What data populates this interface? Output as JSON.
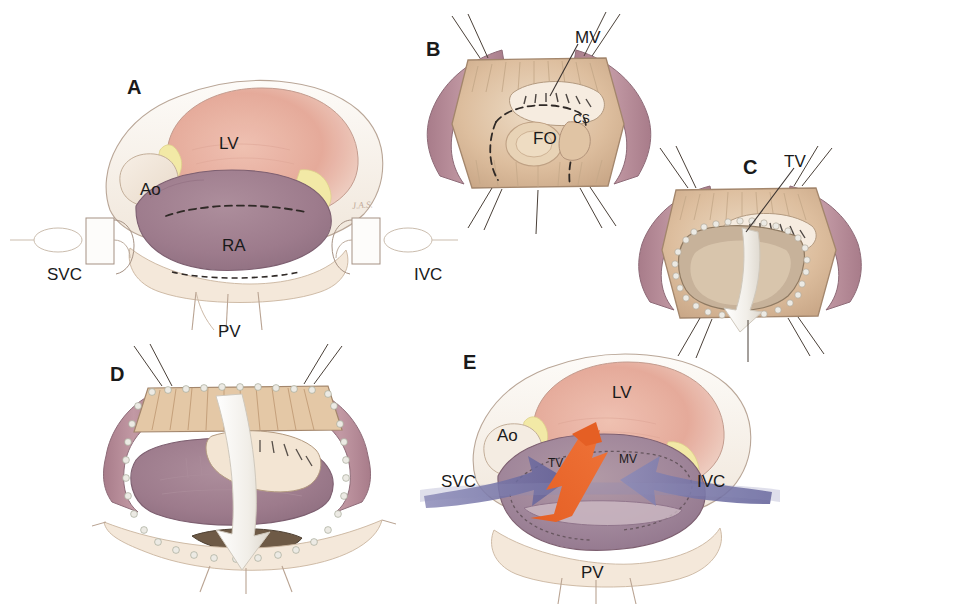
{
  "figure": {
    "background_color": "#ffffff",
    "panel_count": 5
  },
  "palette": {
    "left_ventricle": "#e5a898",
    "right_atrium": "#9d7b8c",
    "aorta_pale": "#f4ece4",
    "pericardium_cream": "#f7f1e8",
    "fat_yellow": "#f2e9a6",
    "endocardium_tan": "#ddbe9e",
    "cut_edge_mauve": "#b08490",
    "suture_dot": "#e8e6e0",
    "dashed_line": "#3a3330",
    "white_arrow": "#f4f2ee",
    "blue_flow_arrow": "#6b6a9e",
    "orange_flow_arrow": "#e8622a",
    "label_text": "#1a1a1a",
    "outline": "#8a7a6e"
  },
  "panels": [
    {
      "id": "panel-a",
      "letter": "A",
      "caption_implicit": "Exposed heart with SVC and IVC cannulated, dashed atriotomy line on right atrium",
      "labels": [
        {
          "name": "lv",
          "text": "LV",
          "x": 219,
          "y": 134
        },
        {
          "name": "ao",
          "text": "Ao",
          "x": 140,
          "y": 180
        },
        {
          "name": "ra",
          "text": "RA",
          "x": 222,
          "y": 236
        },
        {
          "name": "svc",
          "text": "SVC",
          "x": 47,
          "y": 265
        },
        {
          "name": "ivc",
          "text": "IVC",
          "x": 414,
          "y": 265
        },
        {
          "name": "pv",
          "text": "PV",
          "x": 218,
          "y": 322
        }
      ],
      "signature": "J.A.S."
    },
    {
      "id": "panel-b",
      "letter": "B",
      "caption_implicit": "Right atrium opened and retracted with stay sutures, fossa ovalis and coronary sinus exposed",
      "labels": [
        {
          "name": "mv",
          "text": "MV",
          "x": 575,
          "y": 28
        },
        {
          "name": "cs",
          "text": "CS",
          "x": 573,
          "y": 112
        },
        {
          "name": "fo",
          "text": "FO",
          "x": 533,
          "y": 129
        }
      ]
    },
    {
      "id": "panel-c",
      "letter": "C",
      "caption_implicit": "Atrial septum incised with running suture edge, tricuspid valve visualized, white retraction arrow",
      "labels": [
        {
          "name": "tv",
          "text": "TV",
          "x": 784,
          "y": 152
        }
      ]
    },
    {
      "id": "panel-d",
      "letter": "D",
      "caption_implicit": "Septal flap reflected inferiorly, white arrow indicating direction of retraction",
      "labels": []
    },
    {
      "id": "panel-e",
      "letter": "E",
      "caption_implicit": "Completed repair showing systemic venous return routed to tricuspid valve and pulmonary venous return to mitral valve",
      "labels": [
        {
          "name": "lv",
          "text": "LV",
          "x": 612,
          "y": 383
        },
        {
          "name": "ao",
          "text": "Ao",
          "x": 497,
          "y": 426
        },
        {
          "name": "tv",
          "text": "TV",
          "x": 548,
          "y": 456
        },
        {
          "name": "mv",
          "text": "MV",
          "x": 619,
          "y": 452
        },
        {
          "name": "svc",
          "text": "SVC",
          "x": 441,
          "y": 472
        },
        {
          "name": "ivc",
          "text": "IVC",
          "x": 697,
          "y": 472
        },
        {
          "name": "pv",
          "text": "PV",
          "x": 581,
          "y": 563
        }
      ],
      "flow_arrows": [
        {
          "name": "systemic-venous-flow",
          "color": "#6b6a9e",
          "direction": "toward-tricuspid-valve"
        },
        {
          "name": "pulmonary-venous-flow",
          "color": "#e8622a",
          "direction": "toward-mitral-valve"
        }
      ]
    }
  ],
  "panel_letters": [
    {
      "letter": "A",
      "x": 127,
      "y": 76
    },
    {
      "letter": "B",
      "x": 426,
      "y": 38
    },
    {
      "letter": "C",
      "x": 743,
      "y": 156
    },
    {
      "letter": "D",
      "x": 110,
      "y": 363
    },
    {
      "letter": "E",
      "x": 463,
      "y": 351
    }
  ]
}
